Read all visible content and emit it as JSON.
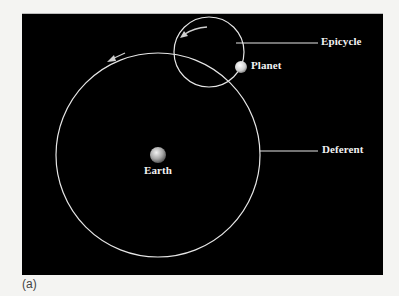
{
  "figure": {
    "caption": "(a)",
    "background": "#000000",
    "line_color": "#e6e6e6",
    "labels": {
      "epicycle": "Epicycle",
      "planet": "Planet",
      "deferent": "Deferent",
      "earth": "Earth"
    },
    "geometry": {
      "deferent": {
        "cx": 158,
        "cy": 155,
        "r": 102
      },
      "epicycle": {
        "cx": 209,
        "cy": 52,
        "r": 35
      },
      "earth": {
        "cx": 158,
        "cy": 155,
        "r": 8
      },
      "planet": {
        "cx": 241,
        "cy": 67,
        "r": 6
      }
    },
    "arrows": [
      {
        "name": "deferent-motion-arrow",
        "direction": "counterclockwise"
      },
      {
        "name": "epicycle-motion-arrow",
        "direction": "counterclockwise"
      }
    ]
  }
}
